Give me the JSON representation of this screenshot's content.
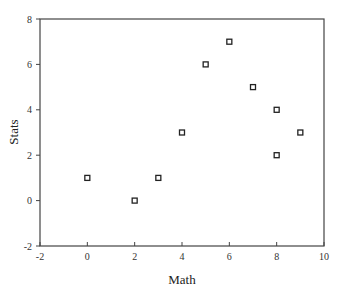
{
  "chart_data": {
    "type": "scatter",
    "title": "",
    "xlabel": "Math",
    "ylabel": "Stats",
    "xlim": [
      -2,
      10
    ],
    "ylim": [
      -2,
      8
    ],
    "xticks": [
      -2,
      0,
      2,
      4,
      6,
      8,
      10
    ],
    "yticks": [
      -2,
      0,
      2,
      4,
      6,
      8
    ],
    "grid": false,
    "legend": null,
    "marker": "open-square",
    "series": [
      {
        "name": "Math vs Stats",
        "x": [
          0,
          2,
          3,
          4,
          5,
          6,
          7,
          8,
          8,
          9
        ],
        "y": [
          1,
          0,
          1,
          3,
          6,
          7,
          5,
          4,
          2,
          3
        ]
      }
    ]
  },
  "colors": {
    "axis": "#444444",
    "marker": "#222222",
    "background": "#ffffff"
  }
}
